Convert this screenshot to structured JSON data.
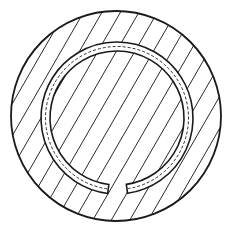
{
  "diagram": {
    "title": "",
    "colors": {
      "background": "#ffffff",
      "stroke": "#1a1a1a",
      "hatch": "#2a2a2a"
    },
    "outer_circle": {
      "cx": 116,
      "cy": 116,
      "r": 105
    },
    "split_ring": {
      "cx": 117,
      "cy": 118,
      "outer_r": 76,
      "inner_r": 67,
      "gap_start_deg": 97,
      "gap_end_deg": 82,
      "dashed_offset_r": 71.5
    },
    "hatch": {
      "angle_deg": 60,
      "spacing": 16
    }
  }
}
